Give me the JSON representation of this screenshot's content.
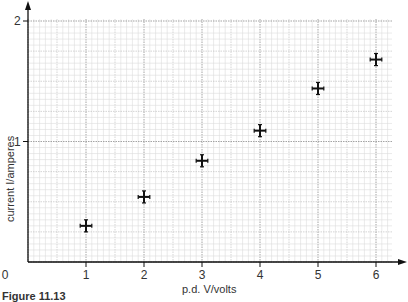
{
  "chart_data": {
    "type": "scatter",
    "title": "",
    "xlabel": "p.d. V/volts",
    "ylabel": "current I/amperes",
    "x_ticks": [
      "0",
      "1",
      "2",
      "3",
      "4",
      "5",
      "6"
    ],
    "y_ticks": [
      "1",
      "2"
    ],
    "xlim": [
      0,
      6.3
    ],
    "ylim": [
      0,
      2.1
    ],
    "grid": true,
    "legend": null,
    "error_bars": {
      "x": 0.1,
      "y": 0.05
    },
    "series": [
      {
        "name": "measurements",
        "x": [
          1,
          2,
          3,
          4,
          5,
          6
        ],
        "y": [
          0.3,
          0.54,
          0.84,
          1.09,
          1.44,
          1.68
        ]
      }
    ]
  },
  "caption": "Figure 11.13"
}
